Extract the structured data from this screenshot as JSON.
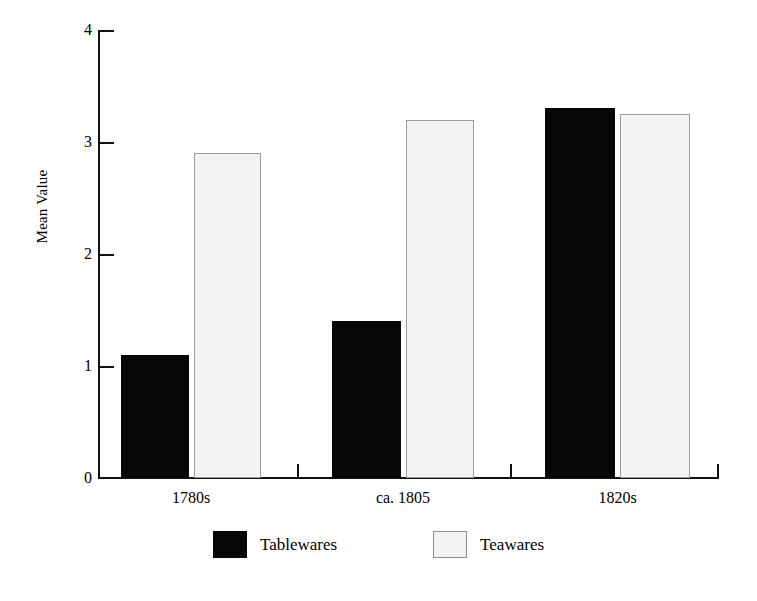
{
  "chart_data": {
    "type": "bar",
    "title": "",
    "xlabel": "",
    "ylabel": "Mean Value",
    "ylim": [
      0,
      4
    ],
    "yticks": [
      0,
      1,
      2,
      3,
      4
    ],
    "ytick_labels": [
      "0",
      "1",
      "2",
      "3",
      "4"
    ],
    "grid": false,
    "legend_position": "bottom-center",
    "categories": [
      "1780s",
      "ca. 1805",
      "1820s"
    ],
    "series": [
      {
        "name": "Tablewares",
        "color": "#070707",
        "values": [
          1.1,
          1.4,
          3.3
        ]
      },
      {
        "name": "Teawares",
        "color": "#f3f3f3",
        "border_color": "#9a9a9a",
        "values": [
          2.9,
          3.2,
          3.25
        ]
      }
    ]
  },
  "axis": {
    "y_label": "Mean Value",
    "ticks": [
      {
        "label": "4",
        "value": 4
      },
      {
        "label": "3",
        "value": 3
      },
      {
        "label": "2",
        "value": 2
      },
      {
        "label": "1",
        "value": 1
      },
      {
        "label": "0",
        "value": 0
      }
    ]
  },
  "groups": [
    {
      "label": "1780s"
    },
    {
      "label": "ca. 1805"
    },
    {
      "label": "1820s"
    }
  ],
  "legend": {
    "entries": [
      {
        "label": "Tablewares",
        "swatch": "solid-black-swatch"
      },
      {
        "label": "Teawares",
        "swatch": "light-gray-swatch"
      }
    ]
  }
}
